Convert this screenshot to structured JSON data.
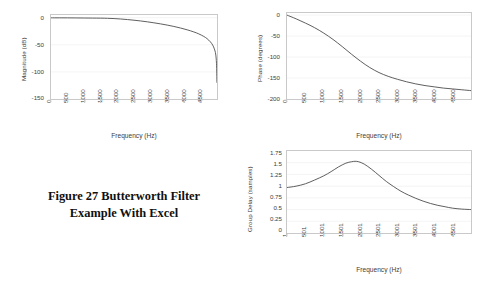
{
  "figure": {
    "caption_line1": "Figure 27  Butterworth Filter",
    "caption_line2": "Example With Excel"
  },
  "chart_data": [
    {
      "id": "magnitude",
      "type": "line",
      "title": "",
      "xlabel": "Frequency (Hz)",
      "ylabel": "Magnitude (dB)",
      "xlim": [
        0,
        5000
      ],
      "ylim": [
        -150,
        5
      ],
      "grid": true,
      "legend": "none",
      "xticks": [
        "0",
        "500",
        "1000",
        "1500",
        "2000",
        "2500",
        "3000",
        "3500",
        "4000",
        "4500"
      ],
      "yticks": [
        "0",
        "-50",
        "-100",
        "-150"
      ],
      "x": [
        0,
        250,
        500,
        750,
        1000,
        1250,
        1500,
        1700,
        1900,
        2100,
        2300,
        2500,
        2700,
        2900,
        3100,
        3300,
        3500,
        3700,
        3900,
        4100,
        4300,
        4450,
        4600,
        4700,
        4800,
        4870,
        4920,
        4960,
        4985,
        4998
      ],
      "y": [
        -0.2,
        -0.25,
        -0.3,
        -0.4,
        -0.55,
        -0.7,
        -0.8,
        -1.1,
        -1.6,
        -2.4,
        -3.4,
        -4.6,
        -6.0,
        -7.6,
        -9.4,
        -11.4,
        -13.6,
        -16.1,
        -19.0,
        -22.3,
        -26.2,
        -29.8,
        -34.5,
        -38.6,
        -44.5,
        -50.5,
        -57.5,
        -67.0,
        -85.0,
        -120.0
      ]
    },
    {
      "id": "phase",
      "type": "line",
      "title": "",
      "xlabel": "Frequency (Hz)",
      "ylabel": "Phase (degrees)",
      "xlim": [
        0,
        5000
      ],
      "ylim": [
        -200,
        5
      ],
      "grid": true,
      "legend": "none",
      "xticks": [
        "0",
        "500",
        "1000",
        "1500",
        "2000",
        "2500",
        "3000",
        "3500",
        "4000",
        "4500"
      ],
      "yticks": [
        "0",
        "-50",
        "-100",
        "-150",
        "-200"
      ],
      "x": [
        0,
        250,
        500,
        750,
        1000,
        1250,
        1500,
        1750,
        2000,
        2250,
        2500,
        2750,
        3000,
        3250,
        3500,
        3750,
        4000,
        4250,
        4500,
        4750,
        5000
      ],
      "y": [
        0,
        -9,
        -19,
        -30,
        -43,
        -58,
        -75,
        -93,
        -110,
        -125,
        -137,
        -146,
        -153,
        -159,
        -164,
        -168,
        -171,
        -174,
        -176,
        -178,
        -180
      ]
    },
    {
      "id": "group-delay",
      "type": "line",
      "title": "",
      "xlabel": "Frequency (Hz)",
      "ylabel": "Group Delay (samples)",
      "xlim": [
        1,
        5001
      ],
      "ylim": [
        0,
        1.75
      ],
      "grid": true,
      "legend": "none",
      "xticks": [
        "1",
        "501",
        "1001",
        "1501",
        "2001",
        "2501",
        "3001",
        "3501",
        "4001",
        "4501"
      ],
      "yticks": [
        "1.75",
        "1.5",
        "1.25",
        "1",
        "0.75",
        "0.5",
        "0.25",
        "0"
      ],
      "x": [
        1,
        250,
        500,
        750,
        1000,
        1200,
        1400,
        1600,
        1750,
        1850,
        1950,
        2100,
        2300,
        2500,
        2700,
        2900,
        3100,
        3300,
        3500,
        3700,
        3900,
        4100,
        4300,
        4500,
        4750,
        5001
      ],
      "y": [
        0.97,
        1.0,
        1.05,
        1.13,
        1.22,
        1.31,
        1.41,
        1.49,
        1.52,
        1.53,
        1.52,
        1.47,
        1.36,
        1.23,
        1.1,
        0.99,
        0.89,
        0.81,
        0.74,
        0.68,
        0.63,
        0.59,
        0.56,
        0.53,
        0.51,
        0.5
      ]
    }
  ]
}
